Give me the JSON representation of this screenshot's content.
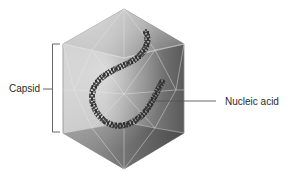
{
  "diagram": {
    "labels": {
      "capsid": "Capsid",
      "nucleic_acid": "Nucleic acid"
    },
    "colors": {
      "background": "#ffffff",
      "label_text": "#2a2a2a",
      "leader_line": "#555555",
      "capsid_light": "#d6d6d6",
      "capsid_mid": "#a8a8a8",
      "capsid_dark": "#5e5e5e",
      "nucleic_acid": "#2b2b2b"
    }
  }
}
